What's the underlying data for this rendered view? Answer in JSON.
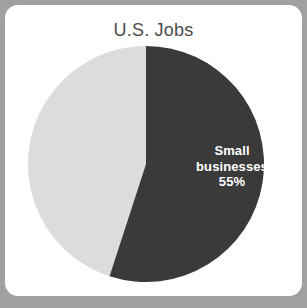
{
  "card": {
    "background_color": "#ffffff",
    "surround_color": "#a0a0a0"
  },
  "chart_data": {
    "type": "pie",
    "title": "U.S. Jobs",
    "categories": [
      "Small businesses",
      "Other"
    ],
    "values": [
      55,
      45
    ],
    "labels": [
      "Small businesses 55%",
      ""
    ],
    "colors": [
      "#3a3a3a",
      "#dcdcdc"
    ],
    "start_angle_deg": 0,
    "direction": "clockwise",
    "legend": "none",
    "grid": false,
    "slices": [
      {
        "name": "Small businesses",
        "value": 55,
        "unit": "%",
        "color": "#3a3a3a",
        "label_line_1": "Small",
        "label_line_2": "businesses",
        "label_line_3": "55%",
        "label_color": "#ffffff"
      },
      {
        "name": "Other",
        "value": 45,
        "unit": "%",
        "color": "#dcdcdc",
        "label_line_1": "",
        "label_line_2": "",
        "label_line_3": "",
        "label_color": "#3a3a3a"
      }
    ]
  },
  "title_color": "#4b4b4b"
}
